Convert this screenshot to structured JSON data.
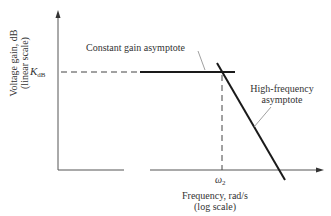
{
  "diagram": {
    "type": "bode-magnitude-asymptote-plot",
    "y_axis": {
      "label_line1": "Voltage gain, dB",
      "label_line2": "(linear scale)"
    },
    "x_axis": {
      "label_line1": "Frequency, rad/s",
      "label_line2": "(log scale)"
    },
    "markers": {
      "gain_level_symbol": "K",
      "gain_level_subscript": "dB",
      "corner_frequency_symbol": "ω",
      "corner_frequency_subscript": "2"
    },
    "annotations": {
      "constant_gain": "Constant gain asymptote",
      "high_freq_line1": "High-frequency",
      "high_freq_line2": "asymptote"
    },
    "colors": {
      "axis": "#555555",
      "asymptote": "#1a1a1a",
      "dashed": "#444444",
      "leader": "#888888"
    }
  }
}
